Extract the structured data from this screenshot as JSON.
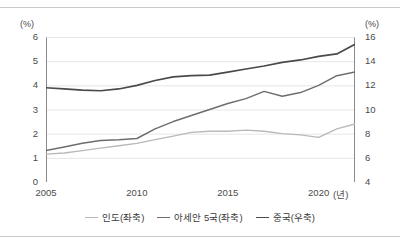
{
  "figure": {
    "left_axis_unit": "(%)",
    "right_axis_unit": "(%)",
    "x_axis_unit": "(년)"
  },
  "legend": {
    "position": "bottom-center",
    "items": [
      {
        "label": "인도(좌축)",
        "color": "#b9b9b9",
        "width": 1.3
      },
      {
        "label": "아세안 5국(좌축)",
        "color": "#6e6e6e",
        "width": 1.6
      },
      {
        "label": "중국(우축)",
        "color": "#4a4a4a",
        "width": 1.8
      }
    ]
  },
  "axes": {
    "left_ticks": [
      "6",
      "5",
      "4",
      "3",
      "2",
      "1",
      "0"
    ],
    "right_ticks": [
      "16",
      "14",
      "12",
      "10",
      "8",
      "6",
      "4"
    ],
    "x_ticks": [
      "2005",
      "2010",
      "2015",
      "2020"
    ]
  },
  "chart_data": {
    "type": "line",
    "title": "",
    "subtitle": "",
    "xlabel": "(년)",
    "ylabel": "(%)",
    "y2label": "(%)",
    "ylim": [
      0,
      6
    ],
    "y2lim": [
      4,
      16
    ],
    "xlim": [
      2005,
      2022
    ],
    "grid": "horizontal",
    "legend_position": "bottom-center",
    "x": [
      2005,
      2006,
      2007,
      2008,
      2009,
      2010,
      2011,
      2012,
      2013,
      2014,
      2015,
      2016,
      2017,
      2018,
      2019,
      2020,
      2021,
      2022
    ],
    "series": [
      {
        "name": "인도(좌축)",
        "axis": "left",
        "color": "#b9b9b9",
        "values": [
          1.15,
          1.2,
          1.3,
          1.4,
          1.5,
          1.6,
          1.75,
          1.9,
          2.05,
          2.1,
          2.1,
          2.15,
          2.1,
          2.0,
          1.95,
          1.85,
          2.2,
          2.4
        ]
      },
      {
        "name": "아세안 5국(좌축)",
        "axis": "left",
        "color": "#6e6e6e",
        "values": [
          1.3,
          1.45,
          1.6,
          1.72,
          1.75,
          1.8,
          2.2,
          2.5,
          2.75,
          3.0,
          3.25,
          3.45,
          3.75,
          3.55,
          3.7,
          4.0,
          4.4,
          4.55
        ]
      },
      {
        "name": "중국(우축)",
        "axis": "right",
        "color": "#4a4a4a",
        "values": [
          11.8,
          11.7,
          11.6,
          11.55,
          11.7,
          12.0,
          12.4,
          12.7,
          12.8,
          12.85,
          13.1,
          13.35,
          13.6,
          13.9,
          14.1,
          14.4,
          14.6,
          15.4
        ]
      }
    ]
  }
}
